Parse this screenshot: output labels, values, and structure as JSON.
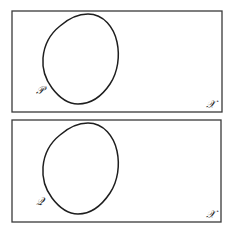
{
  "panels": [
    {
      "set_label": "𝒫",
      "space_label": "𝒳"
    },
    {
      "set_label": "𝒬",
      "space_label": "𝒳"
    }
  ],
  "colors": {
    "stroke": "#1e1e1e",
    "frame": "#3a3a3a",
    "background": "#ffffff"
  }
}
